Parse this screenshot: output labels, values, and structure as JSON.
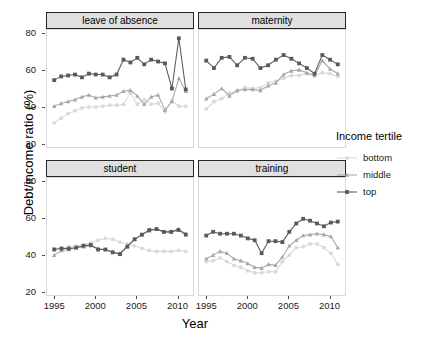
{
  "chart_data": {
    "type": "line",
    "title": "",
    "xlabel": "Year",
    "ylabel": "Debt/income ratio (%)",
    "xlim": [
      1994,
      2012
    ],
    "ylim": [
      18,
      82
    ],
    "xticks": [
      1995,
      2000,
      2005,
      2010
    ],
    "yticks": [
      20,
      40,
      60,
      80
    ],
    "grid": false,
    "legend": {
      "title": "Income tertile",
      "position": "right",
      "entries": [
        "bottom",
        "middle",
        "top"
      ]
    },
    "facets": [
      "leave of absence",
      "maternity",
      "student",
      "training"
    ],
    "series_colors": {
      "bottom": "#d9d9d9",
      "middle": "#a6a6a6",
      "top": "#595959"
    },
    "series_markers": {
      "bottom": "circle",
      "middle": "triangle",
      "top": "square"
    },
    "panels": [
      {
        "facet": "leave of absence",
        "x": [
          1995,
          1996,
          1997,
          1998,
          1999,
          2000,
          2001,
          2002,
          2003,
          2004,
          2005,
          2006,
          2007,
          2008,
          2009,
          2010,
          2011,
          2012
        ],
        "series": [
          {
            "name": "top",
            "values": [
              54.5,
              56.5,
              57.0,
              57.5,
              56.0,
              58.0,
              57.5,
              57.5,
              56.0,
              57.5,
              65.5,
              64.0,
              66.5,
              63.0,
              65.5,
              64.5,
              63.5,
              50.0,
              77.0,
              49.5
            ]
          },
          {
            "name": "middle",
            "values": [
              40.5,
              42.0,
              43.0,
              44.0,
              45.5,
              46.5,
              45.0,
              45.5,
              46.0,
              46.5,
              48.5,
              49.0,
              46.0,
              41.5,
              45.5,
              46.5,
              38.5,
              43.0,
              55.5,
              48.5
            ]
          },
          {
            "name": "bottom",
            "values": [
              31.5,
              34.0,
              36.5,
              38.0,
              39.5,
              40.0,
              40.0,
              40.5,
              41.0,
              41.0,
              41.5,
              47.5,
              41.5,
              44.0,
              41.5,
              42.0,
              37.5,
              43.5,
              40.5,
              40.5
            ]
          }
        ]
      },
      {
        "facet": "maternity",
        "x": [
          1995,
          1996,
          1997,
          1998,
          1999,
          2000,
          2001,
          2002,
          2003,
          2004,
          2005,
          2006,
          2007,
          2008,
          2009,
          2010,
          2011,
          2012
        ],
        "series": [
          {
            "name": "top",
            "values": [
              65.0,
              61.0,
              66.5,
              67.0,
              62.5,
              66.5,
              66.0,
              61.0,
              62.5,
              65.5,
              68.0,
              66.0,
              63.5,
              61.0,
              58.0,
              68.0,
              65.5,
              63.0
            ]
          },
          {
            "name": "middle",
            "values": [
              44.5,
              47.0,
              50.0,
              46.0,
              49.0,
              49.5,
              49.5,
              49.0,
              51.5,
              53.0,
              57.5,
              59.5,
              60.0,
              58.5,
              57.0,
              65.0,
              60.5,
              58.0
            ]
          },
          {
            "name": "bottom",
            "values": [
              39.0,
              43.0,
              44.5,
              47.5,
              48.5,
              50.5,
              50.0,
              50.5,
              53.0,
              54.0,
              55.5,
              57.0,
              57.0,
              58.0,
              57.0,
              58.5,
              58.0,
              56.5
            ]
          }
        ]
      },
      {
        "facet": "student",
        "x": [
          1995,
          1996,
          1997,
          1998,
          1999,
          2000,
          2001,
          2002,
          2003,
          2004,
          2005,
          2006,
          2007,
          2008,
          2009,
          2010,
          2011,
          2012
        ],
        "series": [
          {
            "name": "top",
            "values": [
              43.0,
              43.5,
              43.5,
              44.0,
              45.0,
              45.5,
              43.0,
              43.0,
              41.5,
              40.5,
              44.5,
              48.5,
              51.0,
              53.5,
              54.0,
              52.5,
              52.5,
              53.5,
              51.0
            ]
          },
          {
            "name": "middle",
            "values": [
              40.0,
              42.5,
              43.0,
              44.0,
              44.5,
              45.0,
              43.5,
              43.0,
              41.5,
              41.0,
              45.0,
              48.5,
              51.0,
              53.0,
              54.0,
              52.5,
              52.5,
              54.0,
              51.5
            ]
          },
          {
            "name": "bottom",
            "values": [
              43.5,
              44.0,
              44.5,
              45.0,
              45.5,
              46.5,
              48.0,
              49.0,
              48.5,
              47.0,
              46.0,
              45.0,
              43.5,
              42.5,
              42.0,
              42.0,
              42.0,
              42.5,
              42.0
            ]
          }
        ]
      },
      {
        "facet": "training",
        "x": [
          1995,
          1996,
          1997,
          1998,
          1999,
          2000,
          2001,
          2002,
          2003,
          2004,
          2005,
          2006,
          2007,
          2008,
          2009,
          2010,
          2011,
          2012
        ],
        "series": [
          {
            "name": "top",
            "values": [
              50.5,
              52.5,
              51.5,
              51.5,
              51.5,
              50.5,
              49.0,
              48.0,
              41.0,
              47.5,
              47.5,
              47.0,
              52.5,
              57.0,
              59.5,
              58.5,
              57.0,
              55.5,
              57.5,
              58.0
            ]
          },
          {
            "name": "middle",
            "values": [
              38.0,
              40.0,
              42.0,
              41.0,
              38.0,
              37.0,
              35.5,
              33.5,
              33.0,
              35.0,
              34.5,
              39.0,
              45.0,
              48.0,
              50.5,
              51.0,
              51.5,
              51.0,
              50.0,
              44.0
            ]
          },
          {
            "name": "bottom",
            "values": [
              36.5,
              37.0,
              38.5,
              36.5,
              34.5,
              33.5,
              31.5,
              30.5,
              30.5,
              31.0,
              31.0,
              36.5,
              40.0,
              44.0,
              44.5,
              46.0,
              46.0,
              44.0,
              41.0,
              35.0
            ]
          }
        ]
      }
    ]
  }
}
